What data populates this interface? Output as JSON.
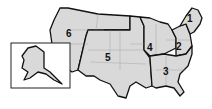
{
  "map": {
    "type": "United States regional map",
    "fill_color": "#d9d9d9",
    "border_color": "#111111",
    "regions": [
      {
        "id": "1",
        "label": "1"
      },
      {
        "id": "2",
        "label": "2"
      },
      {
        "id": "3",
        "label": "3"
      },
      {
        "id": "4",
        "label": "4"
      },
      {
        "id": "5",
        "label": "5"
      },
      {
        "id": "6",
        "label": "6"
      }
    ],
    "inset": {
      "name": "Alaska"
    }
  }
}
